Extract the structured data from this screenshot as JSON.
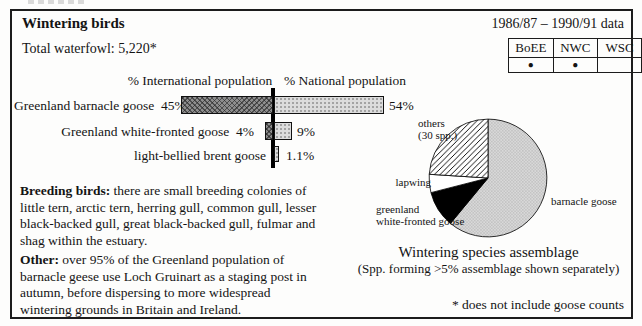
{
  "header": {
    "title": "Wintering birds",
    "period": "1986/87 – 1990/91 data",
    "total": "Total waterfowl: 5,220*"
  },
  "surveys": {
    "columns": [
      "BoEE",
      "NWC",
      "WSC"
    ],
    "marks": [
      "●",
      "●",
      ""
    ]
  },
  "chart_data": [
    {
      "type": "bar",
      "orientation": "horizontal-diverging-from-center-axis",
      "title": "",
      "categories": [
        "Greenland barnacle goose",
        "Greenland white-fronted goose",
        "light-bellied brent goose"
      ],
      "series": [
        {
          "name": "% International population",
          "values": [
            45,
            4,
            null
          ]
        },
        {
          "name": "% National population",
          "values": [
            54,
            9,
            1.1
          ]
        }
      ],
      "data_labels": {
        "international": [
          "45%",
          "4%",
          ""
        ],
        "national": [
          "54%",
          "9%",
          "1.1%"
        ]
      },
      "px_per_pct": 2.04,
      "grid": false,
      "legend": "column headers above chart"
    },
    {
      "type": "pie",
      "title": "Wintering species assemblage",
      "subtitle": "(Spp. forming >5% assemblage shown separately)",
      "labels": [
        "barnacle goose",
        "greenland white-fronted goose",
        "lapwing",
        "others (30 spp.)"
      ],
      "values": [
        61,
        10,
        5,
        24
      ],
      "patterns": [
        "gray-stipple",
        "black",
        "white",
        "diagonal-hatch"
      ],
      "start_angle_deg": 0,
      "direction": "clockwise",
      "legend": "labels adjacent to slices"
    }
  ],
  "pie_labels": {
    "others_line1": "others",
    "others_line2": "(30 spp.)",
    "lapwing": "lapwing",
    "gwfg_line1": "greenland",
    "gwfg_line2": "white-fronted goose",
    "barnacle": "barnacle goose"
  },
  "notes": {
    "breeding": {
      "label": "Breeding birds:",
      "lines": [
        "there are small breeding colonies of",
        "little tern, arctic tern, herring gull, common gull, lesser",
        "black-backed gull, great black-backed gull, fulmar and",
        "shag within the estuary."
      ]
    },
    "other": {
      "label": "Other:",
      "lines": [
        "over 95% of the Greenland population of",
        "barnacle geese use Loch Gruinart as a staging post in",
        "autumn, before dispersing to more widespread",
        "wintering grounds in Britain and Ireland."
      ]
    }
  },
  "footnote": "* does not include goose counts"
}
